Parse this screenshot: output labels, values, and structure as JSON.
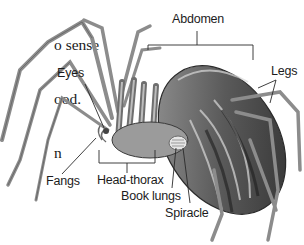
{
  "paragraph": {
    "lines": [
      "o sense",
      "ood.",
      "n"
    ]
  },
  "diagram": {
    "labels": {
      "abdomen": "Abdomen",
      "eyes": "Eyes",
      "legs": "Legs",
      "fangs": "Fangs",
      "head_thorax": "Head-thorax",
      "book_lungs": "Book lungs",
      "spiracle": "Spiracle"
    },
    "colors": {
      "label_text": "#1c1c1c",
      "leader_line": "#2a2a2a",
      "body_dark": "#3a3a3a",
      "body_mid": "#8a8a8a",
      "body_light": "#c9c9c9"
    }
  }
}
